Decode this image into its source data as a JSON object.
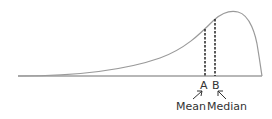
{
  "diagram": {
    "points": {
      "a": {
        "letter": "A",
        "name": "Mean"
      },
      "b": {
        "letter": "B",
        "name": "Median"
      }
    },
    "colors": {
      "curve": "#9a9a9a",
      "baseline": "#707070",
      "dashed": "#222222",
      "text": "#333333"
    }
  }
}
